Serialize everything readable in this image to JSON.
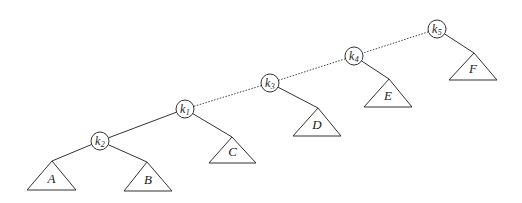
{
  "diagram": {
    "type": "binary-tree-rotation-spine",
    "nodes": [
      {
        "id": "k5",
        "base": "k",
        "sub": "5",
        "cx": 437,
        "cy": 29
      },
      {
        "id": "k4",
        "base": "k",
        "sub": "4",
        "cx": 354,
        "cy": 56
      },
      {
        "id": "k3",
        "base": "k",
        "sub": "3",
        "cx": 270,
        "cy": 83
      },
      {
        "id": "k1",
        "base": "k",
        "sub": "1",
        "cx": 185,
        "cy": 109
      },
      {
        "id": "k2",
        "base": "k",
        "sub": "2",
        "cx": 100,
        "cy": 141
      }
    ],
    "subtrees": [
      {
        "id": "A",
        "label": "A",
        "apex": [
          52,
          161
        ],
        "left": [
          27,
          190
        ],
        "right": [
          76,
          190
        ]
      },
      {
        "id": "B",
        "label": "B",
        "apex": [
          147,
          162
        ],
        "left": [
          124,
          191
        ],
        "right": [
          172,
          191
        ]
      },
      {
        "id": "C",
        "label": "C",
        "apex": [
          232,
          137
        ],
        "left": [
          209,
          163
        ],
        "right": [
          256,
          163
        ]
      },
      {
        "id": "D",
        "label": "D",
        "apex": [
          318,
          108
        ],
        "left": [
          293,
          136
        ],
        "right": [
          341,
          136
        ]
      },
      {
        "id": "E",
        "label": "E",
        "apex": [
          389,
          79
        ],
        "left": [
          364,
          107
        ],
        "right": [
          412,
          107
        ]
      },
      {
        "id": "F",
        "label": "F",
        "apex": [
          474,
          53
        ],
        "left": [
          449,
          80
        ],
        "right": [
          497,
          80
        ]
      }
    ],
    "edges": [
      {
        "from": "k5",
        "to": "k4",
        "style": "dotted"
      },
      {
        "from": "k4",
        "to": "k3",
        "style": "dotted"
      },
      {
        "from": "k3",
        "to": "k1",
        "style": "dotted"
      },
      {
        "from": "k1",
        "to": "k2",
        "style": "solid"
      },
      {
        "from": "k2",
        "to": "A",
        "style": "solid"
      },
      {
        "from": "k2",
        "to": "B",
        "style": "solid"
      },
      {
        "from": "k1",
        "to": "C",
        "style": "solid"
      },
      {
        "from": "k3",
        "to": "D",
        "style": "solid"
      },
      {
        "from": "k4",
        "to": "E",
        "style": "solid"
      },
      {
        "from": "k5",
        "to": "F",
        "style": "solid"
      }
    ],
    "node_radius": 9
  }
}
